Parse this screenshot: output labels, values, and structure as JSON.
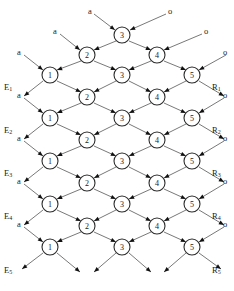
{
  "figure": {
    "title_fragment": "",
    "node_label_sets": {
      "row_a": [
        "1",
        "3",
        "5"
      ],
      "row_b": [
        "2",
        "4"
      ],
      "row_top": [
        "3"
      ]
    }
  },
  "nodes": [
    {
      "id": "n-top-3",
      "label": "3",
      "x": 122,
      "y": 35,
      "r": 8
    },
    {
      "id": "n-r1-2",
      "label": "2",
      "x": 87,
      "y": 55,
      "r": 8
    },
    {
      "id": "n-r1-4",
      "label": "4",
      "x": 157,
      "y": 55,
      "r": 8
    },
    {
      "id": "n-r2-1",
      "label": "1",
      "x": 50,
      "y": 75,
      "r": 8
    },
    {
      "id": "n-r2-3",
      "label": "3",
      "x": 122,
      "y": 75,
      "r": 8
    },
    {
      "id": "n-r2-5",
      "label": "5",
      "x": 192,
      "y": 75,
      "r": 8
    },
    {
      "id": "n-r3-2",
      "label": "2",
      "x": 87,
      "y": 97,
      "r": 8
    },
    {
      "id": "n-r3-4",
      "label": "4",
      "x": 157,
      "y": 97,
      "r": 8
    },
    {
      "id": "n-r4-1",
      "label": "1",
      "x": 50,
      "y": 118,
      "r": 8
    },
    {
      "id": "n-r4-3",
      "label": "3",
      "x": 122,
      "y": 118,
      "r": 8
    },
    {
      "id": "n-r4-5",
      "label": "5",
      "x": 192,
      "y": 118,
      "r": 8
    },
    {
      "id": "n-r5-2",
      "label": "2",
      "x": 87,
      "y": 140,
      "r": 8
    },
    {
      "id": "n-r5-4",
      "label": "4",
      "x": 157,
      "y": 140,
      "r": 8
    },
    {
      "id": "n-r6-1",
      "label": "1",
      "x": 50,
      "y": 161,
      "r": 8
    },
    {
      "id": "n-r6-3",
      "label": "3",
      "x": 122,
      "y": 161,
      "r": 8
    },
    {
      "id": "n-r6-5",
      "label": "5",
      "x": 192,
      "y": 161,
      "r": 8
    },
    {
      "id": "n-r7-2",
      "label": "2",
      "x": 87,
      "y": 183,
      "r": 8
    },
    {
      "id": "n-r7-4",
      "label": "4",
      "x": 157,
      "y": 183,
      "r": 8
    },
    {
      "id": "n-r8-1",
      "label": "1",
      "x": 50,
      "y": 204,
      "r": 8
    },
    {
      "id": "n-r8-3",
      "label": "3",
      "x": 122,
      "y": 204,
      "r": 8
    },
    {
      "id": "n-r8-5",
      "label": "5",
      "x": 192,
      "y": 204,
      "r": 8
    },
    {
      "id": "n-r9-2",
      "label": "2",
      "x": 87,
      "y": 226,
      "r": 8
    },
    {
      "id": "n-r9-4",
      "label": "4",
      "x": 157,
      "y": 226,
      "r": 8
    },
    {
      "id": "n-r10-1",
      "label": "1",
      "x": 50,
      "y": 247,
      "r": 8
    },
    {
      "id": "n-r10-3",
      "label": "3",
      "x": 122,
      "y": 247,
      "r": 8
    },
    {
      "id": "n-r10-5",
      "label": "5",
      "x": 192,
      "y": 247,
      "r": 8
    }
  ],
  "edges": [
    {
      "from": [
        94,
        14
      ],
      "to": [
        115,
        30
      ],
      "arrow": true
    },
    {
      "from": [
        166,
        14
      ],
      "to": [
        130,
        30
      ],
      "arrow": true
    },
    {
      "from": [
        116,
        41
      ],
      "to": [
        94,
        50
      ],
      "arrow": true
    },
    {
      "from": [
        129,
        41
      ],
      "to": [
        151,
        50
      ],
      "arrow": true
    },
    {
      "from": [
        60,
        34
      ],
      "to": [
        80,
        50
      ],
      "arrow": true
    },
    {
      "from": [
        202,
        34
      ],
      "to": [
        164,
        50
      ],
      "arrow": true
    },
    {
      "from": [
        81,
        61
      ],
      "to": [
        57,
        70
      ],
      "arrow": true
    },
    {
      "from": [
        94,
        61
      ],
      "to": [
        116,
        70
      ],
      "arrow": true
    },
    {
      "from": [
        151,
        61
      ],
      "to": [
        129,
        70
      ],
      "arrow": true
    },
    {
      "from": [
        164,
        61
      ],
      "to": [
        186,
        70
      ],
      "arrow": true
    },
    {
      "from": [
        24,
        55
      ],
      "to": [
        43,
        70
      ],
      "arrow": true
    },
    {
      "from": [
        226,
        55
      ],
      "to": [
        199,
        70
      ],
      "arrow": true
    },
    {
      "from": [
        57,
        81
      ],
      "to": [
        81,
        92
      ],
      "arrow": true
    },
    {
      "from": [
        116,
        81
      ],
      "to": [
        94,
        92
      ],
      "arrow": true
    },
    {
      "from": [
        129,
        81
      ],
      "to": [
        151,
        92
      ],
      "arrow": true
    },
    {
      "from": [
        186,
        81
      ],
      "to": [
        164,
        92
      ],
      "arrow": true
    },
    {
      "from": [
        43,
        81
      ],
      "to": [
        24,
        96
      ],
      "arrow": true
    },
    {
      "from": [
        199,
        81
      ],
      "to": [
        224,
        96
      ],
      "arrow": true
    },
    {
      "from": [
        81,
        103
      ],
      "to": [
        57,
        113
      ],
      "arrow": true
    },
    {
      "from": [
        94,
        103
      ],
      "to": [
        116,
        113
      ],
      "arrow": true
    },
    {
      "from": [
        151,
        103
      ],
      "to": [
        129,
        113
      ],
      "arrow": true
    },
    {
      "from": [
        164,
        103
      ],
      "to": [
        186,
        113
      ],
      "arrow": true
    },
    {
      "from": [
        24,
        98
      ],
      "to": [
        43,
        113
      ],
      "arrow": true
    },
    {
      "from": [
        224,
        98
      ],
      "to": [
        199,
        113
      ],
      "arrow": true
    },
    {
      "from": [
        57,
        124
      ],
      "to": [
        81,
        135
      ],
      "arrow": true
    },
    {
      "from": [
        116,
        124
      ],
      "to": [
        94,
        135
      ],
      "arrow": true
    },
    {
      "from": [
        129,
        124
      ],
      "to": [
        151,
        135
      ],
      "arrow": true
    },
    {
      "from": [
        186,
        124
      ],
      "to": [
        164,
        135
      ],
      "arrow": true
    },
    {
      "from": [
        43,
        124
      ],
      "to": [
        24,
        139
      ],
      "arrow": true
    },
    {
      "from": [
        199,
        124
      ],
      "to": [
        224,
        139
      ],
      "arrow": true
    },
    {
      "from": [
        81,
        146
      ],
      "to": [
        57,
        156
      ],
      "arrow": true
    },
    {
      "from": [
        94,
        146
      ],
      "to": [
        116,
        156
      ],
      "arrow": true
    },
    {
      "from": [
        151,
        146
      ],
      "to": [
        129,
        156
      ],
      "arrow": true
    },
    {
      "from": [
        164,
        146
      ],
      "to": [
        186,
        156
      ],
      "arrow": true
    },
    {
      "from": [
        24,
        141
      ],
      "to": [
        43,
        156
      ],
      "arrow": true
    },
    {
      "from": [
        224,
        141
      ],
      "to": [
        199,
        156
      ],
      "arrow": true
    },
    {
      "from": [
        57,
        167
      ],
      "to": [
        81,
        178
      ],
      "arrow": true
    },
    {
      "from": [
        116,
        167
      ],
      "to": [
        94,
        178
      ],
      "arrow": true
    },
    {
      "from": [
        129,
        167
      ],
      "to": [
        151,
        178
      ],
      "arrow": true
    },
    {
      "from": [
        186,
        167
      ],
      "to": [
        164,
        178
      ],
      "arrow": true
    },
    {
      "from": [
        43,
        167
      ],
      "to": [
        24,
        182
      ],
      "arrow": true
    },
    {
      "from": [
        199,
        167
      ],
      "to": [
        224,
        182
      ],
      "arrow": true
    },
    {
      "from": [
        81,
        189
      ],
      "to": [
        57,
        199
      ],
      "arrow": true
    },
    {
      "from": [
        94,
        189
      ],
      "to": [
        116,
        199
      ],
      "arrow": true
    },
    {
      "from": [
        151,
        189
      ],
      "to": [
        129,
        199
      ],
      "arrow": true
    },
    {
      "from": [
        164,
        189
      ],
      "to": [
        186,
        199
      ],
      "arrow": true
    },
    {
      "from": [
        24,
        184
      ],
      "to": [
        43,
        199
      ],
      "arrow": true
    },
    {
      "from": [
        224,
        184
      ],
      "to": [
        199,
        199
      ],
      "arrow": true
    },
    {
      "from": [
        57,
        210
      ],
      "to": [
        81,
        221
      ],
      "arrow": true
    },
    {
      "from": [
        116,
        210
      ],
      "to": [
        94,
        221
      ],
      "arrow": true
    },
    {
      "from": [
        129,
        210
      ],
      "to": [
        151,
        221
      ],
      "arrow": true
    },
    {
      "from": [
        186,
        210
      ],
      "to": [
        164,
        221
      ],
      "arrow": true
    },
    {
      "from": [
        43,
        210
      ],
      "to": [
        24,
        225
      ],
      "arrow": true
    },
    {
      "from": [
        199,
        210
      ],
      "to": [
        224,
        225
      ],
      "arrow": true
    },
    {
      "from": [
        81,
        232
      ],
      "to": [
        57,
        242
      ],
      "arrow": true
    },
    {
      "from": [
        94,
        232
      ],
      "to": [
        116,
        242
      ],
      "arrow": true
    },
    {
      "from": [
        151,
        232
      ],
      "to": [
        129,
        242
      ],
      "arrow": true
    },
    {
      "from": [
        164,
        232
      ],
      "to": [
        186,
        242
      ],
      "arrow": true
    },
    {
      "from": [
        24,
        227
      ],
      "to": [
        43,
        242
      ],
      "arrow": true
    },
    {
      "from": [
        224,
        227
      ],
      "to": [
        199,
        242
      ],
      "arrow": true
    },
    {
      "from": [
        43,
        253
      ],
      "to": [
        22,
        269
      ],
      "arrow": true
    },
    {
      "from": [
        57,
        253
      ],
      "to": [
        80,
        272
      ],
      "arrow": true
    },
    {
      "from": [
        116,
        253
      ],
      "to": [
        94,
        272
      ],
      "arrow": true
    },
    {
      "from": [
        129,
        253
      ],
      "to": [
        151,
        272
      ],
      "arrow": true
    },
    {
      "from": [
        186,
        253
      ],
      "to": [
        164,
        272
      ],
      "arrow": true
    },
    {
      "from": [
        199,
        253
      ],
      "to": [
        221,
        269
      ],
      "arrow": true
    }
  ],
  "labels": {
    "inputs_a": [
      {
        "text": "a",
        "x": 88,
        "y": 7
      },
      {
        "text": "a",
        "x": 53,
        "y": 27
      },
      {
        "text": "a",
        "x": 17,
        "y": 48
      },
      {
        "text": "a",
        "x": 17,
        "y": 91
      },
      {
        "text": "a",
        "x": 17,
        "y": 134
      },
      {
        "text": "a",
        "x": 17,
        "y": 177
      },
      {
        "text": "a",
        "x": 17,
        "y": 220
      }
    ],
    "inputs_o": [
      {
        "text": "o",
        "x": 168,
        "y": 7
      },
      {
        "text": "o",
        "x": 204,
        "y": 27
      },
      {
        "text": "o",
        "x": 223,
        "y": 48
      },
      {
        "text": "o",
        "x": 223,
        "y": 91
      },
      {
        "text": "o",
        "x": 223,
        "y": 134
      },
      {
        "text": "o",
        "x": 223,
        "y": 177
      },
      {
        "text": "o",
        "x": 223,
        "y": 220
      }
    ],
    "outputs_E": [
      {
        "base": "E",
        "sub": "1",
        "x": 4,
        "y": 83
      },
      {
        "base": "E",
        "sub": "2",
        "x": 4,
        "y": 126
      },
      {
        "base": "E",
        "sub": "3",
        "x": 4,
        "y": 169
      },
      {
        "base": "E",
        "sub": "4",
        "x": 4,
        "y": 212
      },
      {
        "base": "E",
        "sub": "5",
        "x": 4,
        "y": 266
      }
    ],
    "outputs_R": [
      {
        "base": "R",
        "sub": "1",
        "x": 212,
        "y": 83
      },
      {
        "base": "R",
        "sub": "2",
        "x": 212,
        "y": 126
      },
      {
        "base": "R",
        "sub": "3",
        "x": 212,
        "y": 169
      },
      {
        "base": "R",
        "sub": "4",
        "x": 212,
        "y": 212
      },
      {
        "base": "R",
        "sub": "5",
        "x": 212,
        "y": 266
      }
    ]
  },
  "colors": {
    "node_stroke": "#2a2a2a",
    "node_fill": "#ffffff",
    "edge": "#555555",
    "arrow": "#111111",
    "text": "#1a1a1a",
    "background": "#ffffff"
  }
}
